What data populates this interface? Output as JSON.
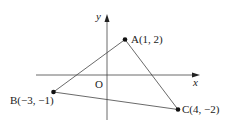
{
  "diagram": {
    "type": "coordinate-plane-triangle",
    "axes": {
      "x_label": "x",
      "y_label": "y",
      "origin_label": "O"
    },
    "points": [
      {
        "name": "A",
        "label": "A(1, 2)",
        "x": 1,
        "y": 2
      },
      {
        "name": "B",
        "label": "B(−3, −1)",
        "x": -3,
        "y": -1
      },
      {
        "name": "C",
        "label": "C(4, −2)",
        "x": 4,
        "y": -2
      }
    ],
    "segments": [
      "AB",
      "AC",
      "BC"
    ]
  }
}
